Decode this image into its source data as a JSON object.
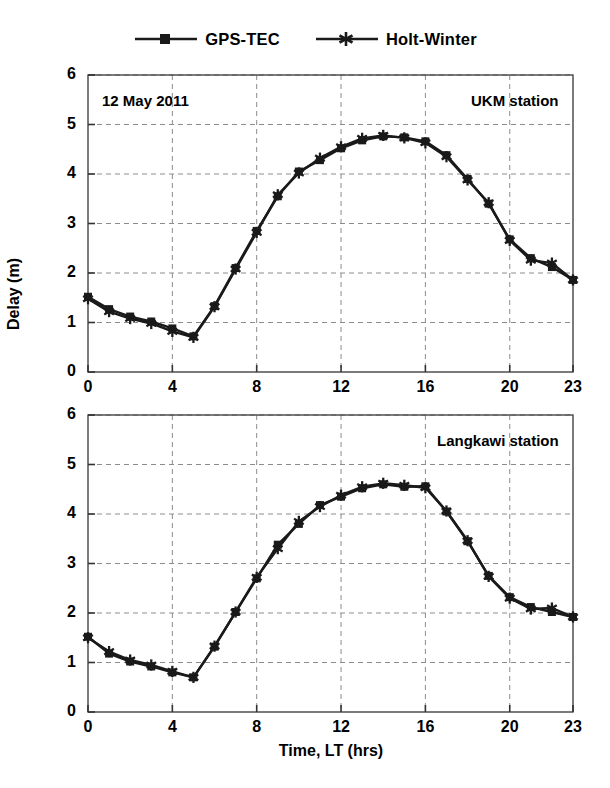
{
  "figure": {
    "width": 610,
    "height": 788,
    "background": "#ffffff",
    "ink_color": "#1a1a1a",
    "grid_color": "#8c8c8c"
  },
  "legend": {
    "position": "top-center",
    "entries": [
      {
        "label": "GPS-TEC",
        "marker": "square",
        "marker_name": "legend-marker-square",
        "color": "#1a1a1a"
      },
      {
        "label": "Holt-Winter",
        "marker": "asterisk",
        "marker_name": "legend-marker-asterisk",
        "color": "#1a1a1a"
      }
    ]
  },
  "axis_titles": {
    "y": "Delay (m)",
    "x": "Time, LT (hrs)"
  },
  "chart_data": [
    {
      "type": "line",
      "id": "ukm-panel",
      "title": "",
      "annotation_left": "12 May 2011",
      "annotation_right": "UKM station",
      "xlabel": "",
      "ylabel": "Delay (m)",
      "xlim": [
        0,
        23
      ],
      "ylim": [
        0,
        6
      ],
      "xticks": [
        0,
        4,
        8,
        12,
        16,
        20,
        23
      ],
      "xticklabels": [
        "0",
        "4",
        "8",
        "12",
        "16",
        "20",
        "23"
      ],
      "yticks": [
        0,
        1,
        2,
        3,
        4,
        5,
        6
      ],
      "yticklabels": [
        "0",
        "1",
        "2",
        "3",
        "4",
        "5",
        "6"
      ],
      "grid": true,
      "grid_style": "dashed",
      "x": [
        0,
        1,
        2,
        3,
        4,
        5,
        6,
        7,
        8,
        9,
        10,
        11,
        12,
        13,
        14,
        15,
        16,
        17,
        18,
        19,
        20,
        21,
        22,
        23
      ],
      "series": [
        {
          "name": "GPS-TEC",
          "marker": "square",
          "values": [
            1.52,
            1.27,
            1.12,
            1.02,
            0.88,
            0.72,
            1.33,
            2.1,
            2.85,
            3.55,
            4.05,
            4.28,
            4.52,
            4.68,
            4.76,
            4.74,
            4.66,
            4.38,
            3.9,
            3.4,
            2.68,
            2.3,
            2.12,
            1.86
          ]
        },
        {
          "name": "Holt-Winter",
          "marker": "asterisk",
          "values": [
            1.48,
            1.22,
            1.08,
            0.98,
            0.82,
            0.7,
            1.32,
            2.08,
            2.82,
            3.58,
            4.02,
            4.32,
            4.55,
            4.72,
            4.78,
            4.73,
            4.63,
            4.35,
            3.88,
            3.42,
            2.66,
            2.26,
            2.2,
            1.86
          ]
        }
      ]
    },
    {
      "type": "line",
      "id": "langkawi-panel",
      "title": "",
      "annotation_left": "",
      "annotation_right": "Langkawi station",
      "xlabel": "Time, LT (hrs)",
      "ylabel": "Delay (m)",
      "xlim": [
        0,
        23
      ],
      "ylim": [
        0,
        6
      ],
      "xticks": [
        0,
        4,
        8,
        12,
        16,
        20,
        23
      ],
      "xticklabels": [
        "0",
        "4",
        "8",
        "12",
        "16",
        "20",
        "23"
      ],
      "yticks": [
        0,
        1,
        2,
        3,
        4,
        5,
        6
      ],
      "yticklabels": [
        "0",
        "1",
        "2",
        "3",
        "4",
        "5",
        "6"
      ],
      "grid": true,
      "grid_style": "dashed",
      "x": [
        0,
        1,
        2,
        3,
        4,
        5,
        6,
        7,
        8,
        9,
        10,
        11,
        12,
        13,
        14,
        15,
        16,
        17,
        18,
        19,
        20,
        21,
        22,
        23
      ],
      "series": [
        {
          "name": "GPS-TEC",
          "marker": "square",
          "values": [
            1.52,
            1.18,
            1.02,
            0.92,
            0.8,
            0.7,
            1.32,
            2.02,
            2.7,
            3.38,
            3.8,
            4.18,
            4.35,
            4.52,
            4.6,
            4.55,
            4.56,
            4.05,
            3.45,
            2.75,
            2.32,
            2.12,
            2.02,
            1.92
          ]
        },
        {
          "name": "Holt-Winter",
          "marker": "asterisk",
          "values": [
            1.5,
            1.22,
            1.05,
            0.95,
            0.82,
            0.7,
            1.33,
            2.02,
            2.72,
            3.3,
            3.85,
            4.15,
            4.38,
            4.55,
            4.62,
            4.58,
            4.53,
            4.06,
            3.46,
            2.74,
            2.3,
            2.08,
            2.1,
            1.92
          ]
        }
      ]
    }
  ]
}
